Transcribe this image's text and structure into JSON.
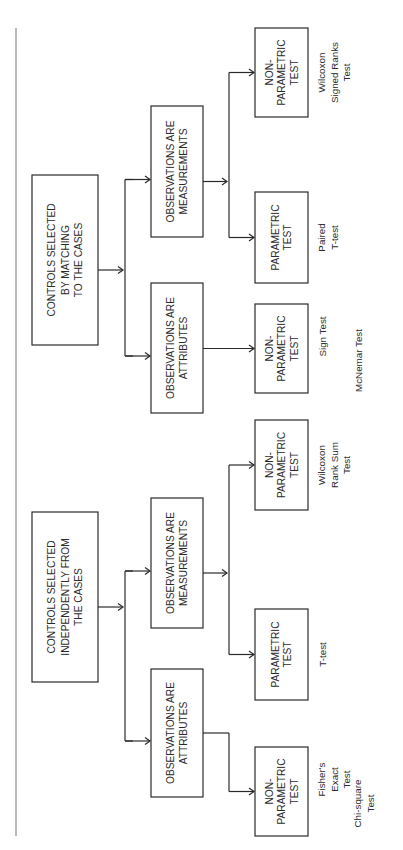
{
  "diagram": {
    "title": "",
    "orientation": "rotated-90-ccw",
    "groups": [
      {
        "root": {
          "id": "matched",
          "lines": [
            "CONTROLS SELECTED",
            "BY MATCHING",
            "TO THE CASES"
          ]
        },
        "branches": [
          {
            "obs": {
              "id": "matched-meas",
              "lines": [
                "OBSERVATIONS ARE",
                "MEASUREMENTS"
              ]
            },
            "tests": [
              {
                "id": "matched-meas-np",
                "lines": [
                  "NON-",
                  "PARAMETRIC",
                  "TEST"
                ],
                "examples": [
                  [
                    "Wilcoxon",
                    "Signed Ranks",
                    "Test"
                  ]
                ]
              },
              {
                "id": "matched-meas-p",
                "lines": [
                  "PARAMETRIC",
                  "TEST"
                ],
                "examples": [
                  [
                    "Paired",
                    "T-test"
                  ]
                ]
              }
            ]
          },
          {
            "obs": {
              "id": "matched-attr",
              "lines": [
                "OBSERVATIONS ARE",
                "ATTRIBUTES"
              ]
            },
            "tests": [
              {
                "id": "matched-attr-np",
                "lines": [
                  "NON-",
                  "PARAMETRIC",
                  "TEST"
                ],
                "examples": [
                  [
                    "Sign Test"
                  ],
                  [
                    "McNemar Test"
                  ]
                ]
              }
            ]
          }
        ]
      },
      {
        "root": {
          "id": "independent",
          "lines": [
            "CONTROLS SELECTED",
            "INDEPENDENTLY FROM",
            "THE CASES"
          ]
        },
        "branches": [
          {
            "obs": {
              "id": "indep-meas",
              "lines": [
                "OBSERVATIONS ARE",
                "MEASUREMENTS"
              ]
            },
            "tests": [
              {
                "id": "indep-meas-np",
                "lines": [
                  "NON-",
                  "PARAMETRIC",
                  "TEST"
                ],
                "examples": [
                  [
                    "Wilcoxon",
                    "Rank Sum",
                    "Test"
                  ]
                ]
              },
              {
                "id": "indep-meas-p",
                "lines": [
                  "PARAMETRIC",
                  "TEST"
                ],
                "examples": [
                  [
                    "T-test"
                  ]
                ]
              }
            ]
          },
          {
            "obs": {
              "id": "indep-attr",
              "lines": [
                "OBSERVATIONS ARE",
                "ATTRIBUTES"
              ]
            },
            "tests": [
              {
                "id": "indep-attr-np",
                "lines": [
                  "NON-",
                  "PARAMETRIC",
                  "TEST"
                ],
                "examples": [
                  [
                    "Fisher's",
                    "Exact",
                    "Test"
                  ],
                  [
                    "Chi-square",
                    "Test"
                  ]
                ]
              }
            ]
          }
        ]
      }
    ]
  }
}
